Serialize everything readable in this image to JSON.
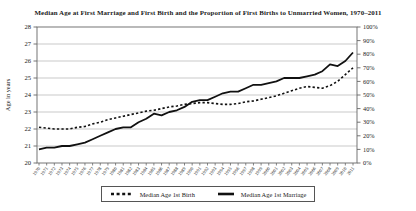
{
  "title": "Median Age at First Marriage and First Birth and the Proportion of First Births to Unmarried Women, 1970–2011",
  "axes": {
    "left": {
      "label": "Age in years",
      "min": 20,
      "max": 28,
      "tick_labels": [
        "20",
        "21",
        "22",
        "23",
        "24",
        "25",
        "26",
        "27",
        "28"
      ]
    },
    "right": {
      "min": 0,
      "max": 100,
      "tick_labels": [
        "0%",
        "10%",
        "20%",
        "30%",
        "40%",
        "50%",
        "60%",
        "70%",
        "80%",
        "90%",
        "100%"
      ]
    }
  },
  "chart_data": {
    "type": "line",
    "title": "Median Age at First Marriage and First Birth and the Proportion of First Births to Unmarried Women, 1970–2011",
    "x": [
      1970,
      1971,
      1972,
      1973,
      1974,
      1975,
      1976,
      1977,
      1978,
      1979,
      1980,
      1981,
      1982,
      1983,
      1984,
      1985,
      1986,
      1987,
      1988,
      1989,
      1990,
      1991,
      1992,
      1993,
      1994,
      1995,
      1996,
      1997,
      1998,
      1999,
      2000,
      2001,
      2002,
      2003,
      2004,
      2005,
      2006,
      2007,
      2008,
      2009,
      2010,
      2011
    ],
    "xlabel": "",
    "ylabel": "Age in years",
    "ylim_left": [
      20,
      28
    ],
    "ylim_right": [
      0,
      100
    ],
    "grid": true,
    "gridlines_at": [
      21,
      22,
      23,
      24,
      25,
      26,
      27
    ],
    "legend_position": "bottom",
    "series": [
      {
        "name": "Median Age 1st Birth",
        "line_style": "dotted",
        "axis": "left",
        "values": [
          22.1,
          22.05,
          22.0,
          22.0,
          22.0,
          22.1,
          22.15,
          22.3,
          22.4,
          22.55,
          22.65,
          22.75,
          22.85,
          22.95,
          23.05,
          23.1,
          23.2,
          23.3,
          23.35,
          23.45,
          23.5,
          23.55,
          23.55,
          23.5,
          23.45,
          23.45,
          23.5,
          23.6,
          23.65,
          23.75,
          23.85,
          23.95,
          24.1,
          24.25,
          24.4,
          24.5,
          24.45,
          24.4,
          24.55,
          24.8,
          25.2,
          25.6
        ]
      },
      {
        "name": "Median Age 1st Marriage",
        "line_style": "solid",
        "axis": "left",
        "values": [
          20.8,
          20.9,
          20.9,
          21.0,
          21.0,
          21.1,
          21.2,
          21.4,
          21.6,
          21.8,
          22.0,
          22.1,
          22.1,
          22.4,
          22.6,
          22.9,
          22.8,
          23.0,
          23.1,
          23.3,
          23.6,
          23.7,
          23.7,
          23.9,
          24.1,
          24.2,
          24.2,
          24.4,
          24.6,
          24.6,
          24.7,
          24.8,
          25.0,
          25.0,
          25.0,
          25.1,
          25.2,
          25.4,
          25.8,
          25.7,
          26.0,
          26.5
        ]
      }
    ]
  },
  "legend": {
    "items": [
      {
        "label": "Median Age 1st Birth",
        "style": "dotted"
      },
      {
        "label": "Median Age 1st Marriage",
        "style": "solid"
      }
    ]
  },
  "colors": {
    "line": "#111111",
    "grid": "#b3b3b3",
    "frame": "#666666",
    "text": "#1a1a1a",
    "background": "#ffffff"
  }
}
